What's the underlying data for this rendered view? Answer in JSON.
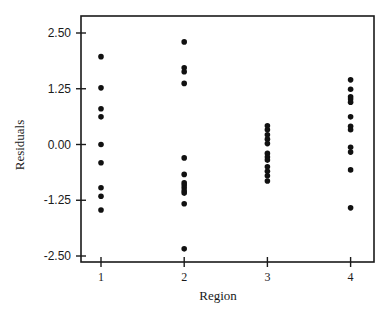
{
  "chart_data": {
    "type": "scatter",
    "title": "",
    "xlabel": "Region",
    "ylabel": "Residuals",
    "x_ticks": [
      "1",
      "2",
      "3",
      "4"
    ],
    "y_ticks": [
      "2.50",
      "1.25",
      "0.00",
      "-1.25",
      "-2.50"
    ],
    "y_tick_values": [
      2.5,
      1.25,
      0.0,
      -1.25,
      -2.5
    ],
    "xlim": [
      0.77,
      4.3
    ],
    "ylim": [
      -2.58,
      2.87
    ],
    "grid": false,
    "legend": null,
    "marker_color": "#111111",
    "series": [
      {
        "name": "Region 1",
        "x": 1,
        "values": [
          1.97,
          1.27,
          0.8,
          0.62,
          0.0,
          -0.41,
          -0.97,
          -1.16,
          -1.47
        ]
      },
      {
        "name": "Region 2",
        "x": 2,
        "values": [
          2.3,
          1.72,
          1.63,
          1.37,
          -0.3,
          -0.67,
          -0.86,
          -0.91,
          -0.97,
          -1.04,
          -1.09,
          -1.33,
          -2.34
        ]
      },
      {
        "name": "Region 3",
        "x": 3,
        "values": [
          0.42,
          0.33,
          0.22,
          0.12,
          0.02,
          -0.2,
          -0.28,
          -0.35,
          -0.5,
          -0.6,
          -0.7,
          -0.82
        ]
      },
      {
        "name": "Region 4",
        "x": 4,
        "values": [
          1.45,
          1.24,
          1.07,
          1.02,
          0.95,
          0.62,
          0.41,
          0.33,
          -0.06,
          -0.17,
          -0.57,
          -1.42
        ]
      }
    ]
  }
}
